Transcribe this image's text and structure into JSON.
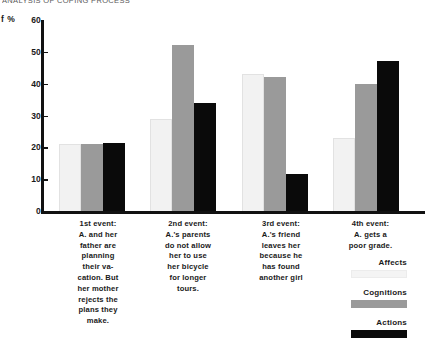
{
  "figure": {
    "running_title": "ANALYSIS OF COPING PROCESS"
  },
  "chart_data": {
    "type": "bar",
    "title": "ANALYSIS OF COPING PROCESS",
    "xlabel": "",
    "ylabel": "f %",
    "ylim": [
      0,
      60
    ],
    "yticks": [
      0,
      10,
      20,
      30,
      40,
      50,
      60
    ],
    "grid": false,
    "legend_position": "bottom-right",
    "categories": [
      "1st event: A. and her father are planning their vacation. But her mother rejects the plans they make.",
      "2nd event: A.'s parents do not allow her to use her bicycle for longer tours.",
      "3rd event: A.'s friend leaves her because he has found another girl",
      "4th event: A. gets a poor grade."
    ],
    "series": [
      {
        "name": "Affects",
        "color": "#f2f2f2",
        "values": [
          21,
          29,
          43,
          23
        ]
      },
      {
        "name": "Cognitions",
        "color": "#9a9a9a",
        "values": [
          21,
          52,
          42,
          40
        ]
      },
      {
        "name": "Actions",
        "color": "#0a0a0a",
        "values": [
          21.5,
          34,
          11.5,
          47
        ]
      }
    ]
  },
  "axis": {
    "y_label": "f %",
    "ticks": [
      {
        "value": 60,
        "label": "60"
      },
      {
        "value": 50,
        "label": "50"
      },
      {
        "value": 40,
        "label": "40"
      },
      {
        "value": 30,
        "label": "30"
      },
      {
        "value": 20,
        "label": "20"
      },
      {
        "value": 10,
        "label": "10"
      },
      {
        "value": 0,
        "label": "0"
      }
    ]
  },
  "captions": [
    {
      "lines": [
        "1st event:",
        "A. and her",
        "father are",
        "planning",
        "their va-",
        "cation. But",
        "her mother",
        "rejects the",
        "plans they",
        "make."
      ]
    },
    {
      "lines": [
        "2nd event:",
        "A.'s parents",
        "do not allow",
        "her to use",
        "her bicycle",
        "for longer",
        "tours."
      ]
    },
    {
      "lines": [
        "3rd event:",
        "A.'s friend",
        "leaves her",
        "because he",
        "has found",
        "another girl"
      ]
    },
    {
      "lines": [
        "4th event:",
        "A. gets a",
        "poor grade."
      ]
    }
  ],
  "legend": {
    "entries": [
      {
        "label": "Affects",
        "swatch": "affects"
      },
      {
        "label": "Cognitions",
        "swatch": "cognitions"
      },
      {
        "label": "Actions",
        "swatch": "actions"
      }
    ]
  }
}
